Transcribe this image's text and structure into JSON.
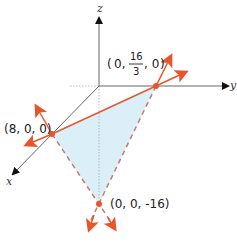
{
  "axes": {
    "x_label": "x",
    "y_label": "y",
    "z_label": "z"
  },
  "points": {
    "y_intercept": {
      "label_prefix": "(0,",
      "frac_num": "16",
      "frac_den": "3",
      "label_suffix": ", 0)"
    },
    "x_intercept": {
      "label": "(8, 0, 0)"
    },
    "z_intercept": {
      "label": "(0, 0, -16)"
    }
  },
  "colors": {
    "line": "#e8552b",
    "dashed": "#c97a6a",
    "fill": "#d3ecf7",
    "axis": "#666666"
  }
}
